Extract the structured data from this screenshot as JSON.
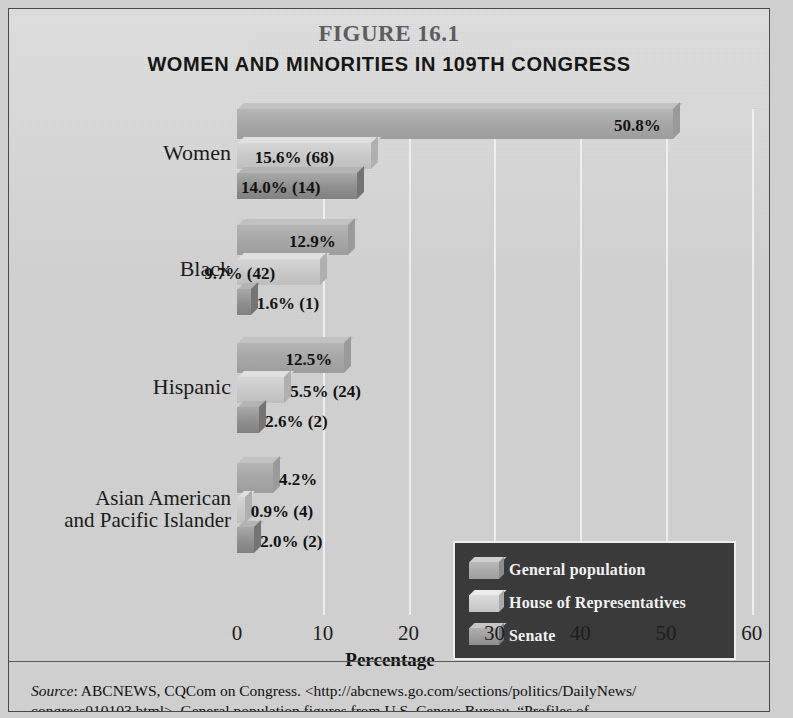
{
  "figure": {
    "number": "FIGURE 16.1",
    "title": "WOMEN AND MINORITIES IN 109TH CONGRESS"
  },
  "chart_data": {
    "type": "bar",
    "orientation": "horizontal",
    "title": "WOMEN AND MINORITIES IN 109TH CONGRESS",
    "xlabel": "Percentage",
    "ylabel": "",
    "xlim": [
      0,
      60
    ],
    "xticks": [
      0,
      10,
      20,
      30,
      40,
      50,
      60
    ],
    "grid": true,
    "legend_position": "inside-right-lower",
    "categories": [
      "Women",
      "Black",
      "Hispanic",
      "Asian American and Pacific Islander"
    ],
    "series": [
      {
        "name": "General population",
        "values": [
          50.8,
          12.9,
          12.5,
          4.2
        ],
        "labels": [
          "50.8%",
          "12.9%",
          "12.5%",
          "4.2%"
        ],
        "counts": [
          null,
          null,
          null,
          null
        ]
      },
      {
        "name": "House of Representatives",
        "values": [
          15.6,
          9.7,
          5.5,
          0.9
        ],
        "labels": [
          "15.6%",
          "9.7%",
          "5.5%",
          "0.9%"
        ],
        "counts": [
          "(68)",
          "(42)",
          "(24)",
          "(4)"
        ]
      },
      {
        "name": "Senate",
        "values": [
          14.0,
          1.6,
          2.6,
          2.0
        ],
        "labels": [
          "14.0%",
          "1.6%",
          "2.6%",
          "2.0%"
        ],
        "counts": [
          "(14)",
          "(1)",
          "(2)",
          "(2)"
        ]
      }
    ]
  },
  "axis": {
    "ticks": [
      "0",
      "10",
      "20",
      "30",
      "40",
      "50",
      "60"
    ],
    "title": "Percentage"
  },
  "groups": [
    {
      "label": "Women",
      "label_line1": "Women",
      "label_line2": "",
      "bars": [
        {
          "series": "general",
          "value": 50.8,
          "label": "50.8%",
          "count": ""
        },
        {
          "series": "house",
          "value": 15.6,
          "label": "15.6%",
          "count": "(68)"
        },
        {
          "series": "senate",
          "value": 14.0,
          "label": "14.0%",
          "count": "(14)"
        }
      ]
    },
    {
      "label": "Black",
      "label_line1": "Black",
      "label_line2": "",
      "bars": [
        {
          "series": "general",
          "value": 12.9,
          "label": "12.9%",
          "count": ""
        },
        {
          "series": "house",
          "value": 9.7,
          "label": "9.7%",
          "count": "(42)"
        },
        {
          "series": "senate",
          "value": 1.6,
          "label": "1.6%",
          "count": "(1)"
        }
      ]
    },
    {
      "label": "Hispanic",
      "label_line1": "Hispanic",
      "label_line2": "",
      "bars": [
        {
          "series": "general",
          "value": 12.5,
          "label": "12.5%",
          "count": ""
        },
        {
          "series": "house",
          "value": 5.5,
          "label": "5.5%",
          "count": "(24)"
        },
        {
          "series": "senate",
          "value": 2.6,
          "label": "2.6%",
          "count": "(2)"
        }
      ]
    },
    {
      "label": "Asian American and Pacific Islander",
      "label_line1": "Asian American",
      "label_line2": "and Pacific Islander",
      "bars": [
        {
          "series": "general",
          "value": 4.2,
          "label": "4.2%",
          "count": ""
        },
        {
          "series": "house",
          "value": 0.9,
          "label": "0.9%",
          "count": "(4)"
        },
        {
          "series": "senate",
          "value": 2.0,
          "label": "2.0%",
          "count": "(2)"
        }
      ]
    }
  ],
  "legend": {
    "items": [
      {
        "key": "general",
        "label": "General population"
      },
      {
        "key": "house",
        "label": "House of Representatives"
      },
      {
        "key": "senate",
        "label": "Senate"
      }
    ]
  },
  "source_note": {
    "prefix": "Source",
    "line1": ": ABCNEWS, CQCom on Congress. <http://abcnews.go.com/sections/politics/DailyNews/",
    "line2": "congress010103.html>. General population figures from U.S. Census Bureau, “Profiles of"
  },
  "colors": {
    "background": "#d2d2d2",
    "general_bar": "#a8a8a8",
    "house_bar": "#c9c9c9",
    "senate_bar": "#8f8f8f",
    "legend_background": "#3a3a3a",
    "legend_text": "#f2f2f2",
    "gridline": "#f2f2f2",
    "frame_border": "#4a4a4a"
  }
}
